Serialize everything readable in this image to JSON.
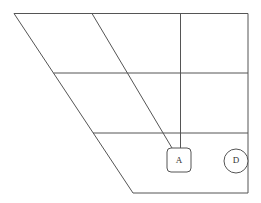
{
  "diagram": {
    "type": "vowel-chart-trapezoid",
    "stroke_color": "#555555",
    "nodes": [
      {
        "id": "A",
        "label": "A",
        "shape": "rounded-square"
      },
      {
        "id": "D",
        "label": "D",
        "shape": "circle"
      }
    ]
  }
}
